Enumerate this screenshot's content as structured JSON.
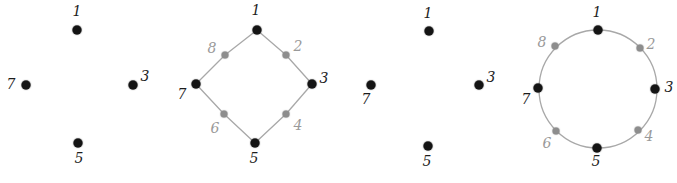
{
  "figure": {
    "width": 677,
    "height": 183,
    "background": "#ffffff",
    "colors": {
      "dark_node": "#141414",
      "gray_node": "#8d8d8d",
      "dark_label": "#1c1c1c",
      "gray_label": "#9a9a9a",
      "edge": "#a8a8a8",
      "background": "#ffffff"
    }
  },
  "panels": [
    {
      "name": "four-dots-left",
      "left": 0,
      "width": 165,
      "shape": "none",
      "nodes": [
        {
          "label": "1",
          "tone": "dark",
          "x": 77,
          "y": 30,
          "label_x": 77,
          "label_y": 11
        },
        {
          "label": "3",
          "tone": "dark",
          "x": 133,
          "y": 85,
          "label_x": 145,
          "label_y": 76
        },
        {
          "label": "5",
          "tone": "dark",
          "x": 78,
          "y": 143,
          "label_x": 79,
          "label_y": 158
        },
        {
          "label": "7",
          "tone": "dark",
          "x": 26,
          "y": 85,
          "label_x": 11,
          "label_y": 84
        }
      ],
      "edges": []
    },
    {
      "name": "diamond-eight-points",
      "left": 165,
      "width": 180,
      "shape": "diamond",
      "nodes": [
        {
          "label": "1",
          "tone": "dark",
          "x": 92,
          "y": 30,
          "label_x": 91,
          "label_y": 10
        },
        {
          "label": "2",
          "tone": "gray",
          "x": 121,
          "y": 55,
          "label_x": 133,
          "label_y": 46
        },
        {
          "label": "3",
          "tone": "dark",
          "x": 147,
          "y": 84,
          "label_x": 159,
          "label_y": 78
        },
        {
          "label": "4",
          "tone": "gray",
          "x": 121,
          "y": 114,
          "label_x": 133,
          "label_y": 125
        },
        {
          "label": "5",
          "tone": "dark",
          "x": 90,
          "y": 143,
          "label_x": 89,
          "label_y": 158
        },
        {
          "label": "6",
          "tone": "gray",
          "x": 59,
          "y": 114,
          "label_x": 50,
          "label_y": 128
        },
        {
          "label": "7",
          "tone": "dark",
          "x": 31,
          "y": 84,
          "label_x": 17,
          "label_y": 94
        },
        {
          "label": "8",
          "tone": "gray",
          "x": 60,
          "y": 55,
          "label_x": 47,
          "label_y": 48
        }
      ],
      "edges": [
        [
          0,
          1
        ],
        [
          1,
          2
        ],
        [
          2,
          3
        ],
        [
          3,
          4
        ],
        [
          4,
          5
        ],
        [
          5,
          6
        ],
        [
          6,
          7
        ],
        [
          7,
          0
        ]
      ]
    },
    {
      "name": "four-dots-right",
      "left": 345,
      "width": 165,
      "shape": "none",
      "nodes": [
        {
          "label": "1",
          "tone": "dark",
          "x": 84,
          "y": 31,
          "label_x": 83,
          "label_y": 13
        },
        {
          "label": "3",
          "tone": "dark",
          "x": 134,
          "y": 85,
          "label_x": 146,
          "label_y": 77
        },
        {
          "label": "5",
          "tone": "dark",
          "x": 83,
          "y": 146,
          "label_x": 82,
          "label_y": 161
        },
        {
          "label": "7",
          "tone": "dark",
          "x": 26,
          "y": 85,
          "label_x": 21,
          "label_y": 99
        }
      ],
      "edges": []
    },
    {
      "name": "circle-eight-points",
      "left": 510,
      "width": 167,
      "shape": "circle",
      "circle": {
        "cx": 88,
        "cy": 89,
        "r": 59
      },
      "nodes": [
        {
          "label": "1",
          "tone": "dark",
          "x": 88,
          "y": 30,
          "label_x": 87,
          "label_y": 12
        },
        {
          "label": "2",
          "tone": "gray",
          "x": 130,
          "y": 48,
          "label_x": 141,
          "label_y": 44
        },
        {
          "label": "3",
          "tone": "dark",
          "x": 145,
          "y": 89,
          "label_x": 159,
          "label_y": 87
        },
        {
          "label": "4",
          "tone": "gray",
          "x": 128,
          "y": 130,
          "label_x": 139,
          "label_y": 136
        },
        {
          "label": "5",
          "tone": "dark",
          "x": 87,
          "y": 148,
          "label_x": 86,
          "label_y": 161
        },
        {
          "label": "6",
          "tone": "gray",
          "x": 46,
          "y": 131,
          "label_x": 37,
          "label_y": 143
        },
        {
          "label": "7",
          "tone": "dark",
          "x": 28,
          "y": 88,
          "label_x": 16,
          "label_y": 99
        },
        {
          "label": "8",
          "tone": "gray",
          "x": 45,
          "y": 46,
          "label_x": 32,
          "label_y": 42
        }
      ],
      "edges": [
        [
          0,
          1
        ],
        [
          1,
          2
        ],
        [
          2,
          3
        ],
        [
          3,
          4
        ],
        [
          4,
          5
        ],
        [
          5,
          6
        ],
        [
          6,
          7
        ],
        [
          7,
          0
        ]
      ]
    }
  ]
}
